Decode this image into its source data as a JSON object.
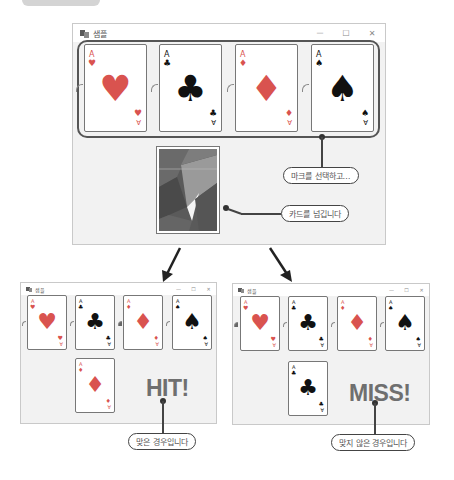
{
  "main_window": {
    "title": "샘플",
    "controls": {
      "minimize": "—",
      "maximize": "☐",
      "close": "✕"
    },
    "cards": [
      {
        "rank": "A",
        "suit": "♥",
        "color": "red",
        "suit_name": "heart"
      },
      {
        "rank": "A",
        "suit": "♣",
        "color": "black",
        "suit_name": "club"
      },
      {
        "rank": "A",
        "suit": "♦",
        "color": "red",
        "suit_name": "diamond"
      },
      {
        "rank": "A",
        "suit": "♠",
        "color": "black",
        "suit_name": "spade"
      }
    ],
    "rank_bottom": "∀",
    "callouts": {
      "select_mark": "마크를 선택하고…",
      "flip_card": "카드를 넘깁니다"
    }
  },
  "hit_window": {
    "title": "샘플",
    "controls": {
      "minimize": "—",
      "maximize": "☐",
      "close": "✕"
    },
    "drawn_card": {
      "rank": "A",
      "suit": "♦",
      "color": "red"
    },
    "result": "HIT!",
    "callout": "맞은 경우입니다"
  },
  "miss_window": {
    "title": "샘플",
    "controls": {
      "minimize": "—",
      "maximize": "☐",
      "close": "✕"
    },
    "drawn_card": {
      "rank": "A",
      "suit": "♣",
      "color": "black"
    },
    "result": "MISS!",
    "callout": "맞지 않은 경우입니다"
  },
  "colors": {
    "red_suit": "#d9534f",
    "black_suit": "#111111",
    "window_bg": "#f2f2f2",
    "result_text": "#6f6f6f"
  }
}
